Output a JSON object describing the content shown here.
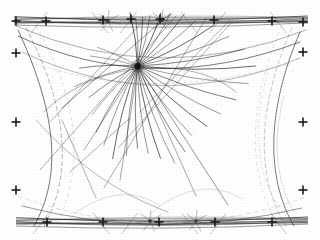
{
  "figure": {
    "kind": "particle-detector-event-display",
    "background_color": "#ffffff",
    "ink_color": "#2b2b2b",
    "faint_ink_color": "#7a7a7a",
    "width": 320,
    "height": 240
  },
  "fiducial": {
    "label": "fiducial-marks",
    "mark_glyph": "plus-cross",
    "color": "#1a1a1a",
    "arm_length": 4.5,
    "stroke": 1.6,
    "marks": [
      {
        "id": "fid-tl",
        "x": 16,
        "y": 21
      },
      {
        "id": "fid-t1",
        "x": 46,
        "y": 21
      },
      {
        "id": "fid-t2",
        "x": 103,
        "y": 20
      },
      {
        "id": "fid-t3",
        "x": 131,
        "y": 19
      },
      {
        "id": "fid-t4",
        "x": 160,
        "y": 19
      },
      {
        "id": "fid-t5",
        "x": 214,
        "y": 20
      },
      {
        "id": "fid-t6",
        "x": 272,
        "y": 21
      },
      {
        "id": "fid-tr",
        "x": 303,
        "y": 22
      },
      {
        "id": "fid-l1",
        "x": 16,
        "y": 53
      },
      {
        "id": "fid-l2",
        "x": 16,
        "y": 122
      },
      {
        "id": "fid-l3",
        "x": 16,
        "y": 190
      },
      {
        "id": "fid-r1",
        "x": 303,
        "y": 52
      },
      {
        "id": "fid-r2",
        "x": 303,
        "y": 122
      },
      {
        "id": "fid-r3",
        "x": 303,
        "y": 190
      },
      {
        "id": "fid-b1",
        "x": 47,
        "y": 222
      },
      {
        "id": "fid-b2",
        "x": 103,
        "y": 222
      },
      {
        "id": "fid-b3",
        "x": 159,
        "y": 222
      },
      {
        "id": "fid-b4",
        "x": 215,
        "y": 222
      },
      {
        "id": "fid-b5",
        "x": 272,
        "y": 222
      }
    ]
  },
  "vertex": {
    "label": "primary-interaction-vertex",
    "x": 137.5,
    "y": 66,
    "blob_radius": 3.2,
    "color": "#111111",
    "track_count": 30
  },
  "secondary_vertices": [
    {
      "id": "sv-top-a",
      "x": 108,
      "y": 21,
      "r": 2.0
    },
    {
      "id": "sv-top-b",
      "x": 162,
      "y": 20,
      "r": 2.2
    },
    {
      "id": "sv-bottom-a",
      "x": 150,
      "y": 221,
      "r": 2.0
    },
    {
      "id": "sv-bottom-b",
      "x": 196,
      "y": 221,
      "r": 1.8
    }
  ],
  "chart_data": {
    "type": "scatter",
    "title": "",
    "xlabel": "",
    "ylabel": "",
    "grid": false,
    "legend": "none",
    "xlim": [
      0,
      320
    ],
    "ylim": [
      0,
      240
    ],
    "vertex_tracks_deg": [
      -96,
      -88,
      -80,
      -72,
      -64,
      -56,
      -48,
      -40,
      -30,
      -20,
      -8,
      4,
      16,
      28,
      40,
      52,
      62,
      70,
      78,
      86,
      94,
      100,
      108,
      116,
      124,
      134,
      146,
      160,
      176,
      190
    ]
  },
  "tracks": {
    "vertex_spray": [
      {
        "id": "t01",
        "angle": -98,
        "len": 54,
        "w": 0.9,
        "op": 0.85
      },
      {
        "id": "t02",
        "angle": -92,
        "len": 47,
        "w": 0.7,
        "op": 0.75
      },
      {
        "id": "t03",
        "angle": -84,
        "len": 49,
        "w": 0.8,
        "op": 0.8
      },
      {
        "id": "t04",
        "angle": -76,
        "len": 52,
        "w": 0.7,
        "op": 0.7
      },
      {
        "id": "t05",
        "angle": -66,
        "len": 58,
        "w": 0.9,
        "op": 0.85
      },
      {
        "id": "t06",
        "angle": -58,
        "len": 62,
        "w": 0.7,
        "op": 0.7
      },
      {
        "id": "t07",
        "angle": -48,
        "len": 70,
        "w": 0.8,
        "op": 0.78
      },
      {
        "id": "t08",
        "angle": -38,
        "len": 74,
        "w": 0.7,
        "op": 0.68
      },
      {
        "id": "t09",
        "angle": -28,
        "len": 86,
        "w": 0.9,
        "op": 0.82
      },
      {
        "id": "t10",
        "angle": -18,
        "len": 96,
        "w": 0.7,
        "op": 0.7
      },
      {
        "id": "t11",
        "angle": -9,
        "len": 108,
        "w": 0.8,
        "op": 0.75
      },
      {
        "id": "t12",
        "angle": 0,
        "len": 118,
        "w": 0.9,
        "op": 0.8
      },
      {
        "id": "t13",
        "angle": 9,
        "len": 112,
        "w": 0.7,
        "op": 0.66
      },
      {
        "id": "t14",
        "angle": 19,
        "len": 104,
        "w": 0.8,
        "op": 0.74
      },
      {
        "id": "t15",
        "angle": 30,
        "len": 96,
        "w": 0.7,
        "op": 0.68
      },
      {
        "id": "t16",
        "angle": 41,
        "len": 92,
        "w": 0.9,
        "op": 0.8
      },
      {
        "id": "t17",
        "angle": 52,
        "len": 88,
        "w": 0.7,
        "op": 0.7
      },
      {
        "id": "t18",
        "angle": 61,
        "len": 98,
        "w": 0.8,
        "op": 0.76
      },
      {
        "id": "t19",
        "angle": 69,
        "len": 104,
        "w": 0.7,
        "op": 0.68
      },
      {
        "id": "t20",
        "angle": 76,
        "len": 95,
        "w": 0.9,
        "op": 0.82
      },
      {
        "id": "t21",
        "angle": 83,
        "len": 88,
        "w": 0.7,
        "op": 0.7
      },
      {
        "id": "t22",
        "angle": 90,
        "len": 82,
        "w": 0.8,
        "op": 0.76
      },
      {
        "id": "t23",
        "angle": 97,
        "len": 90,
        "w": 0.7,
        "op": 0.68
      },
      {
        "id": "t24",
        "angle": 105,
        "len": 96,
        "w": 0.9,
        "op": 0.8
      },
      {
        "id": "t25",
        "angle": 113,
        "len": 86,
        "w": 0.7,
        "op": 0.68
      },
      {
        "id": "t26",
        "angle": 122,
        "len": 78,
        "w": 0.8,
        "op": 0.74
      },
      {
        "id": "t27",
        "angle": 133,
        "len": 66,
        "w": 0.7,
        "op": 0.66
      },
      {
        "id": "t28",
        "angle": 147,
        "len": 58,
        "w": 0.8,
        "op": 0.72
      },
      {
        "id": "t29",
        "angle": 162,
        "len": 66,
        "w": 0.7,
        "op": 0.66
      },
      {
        "id": "t30",
        "angle": 178,
        "len": 58,
        "w": 0.8,
        "op": 0.74
      },
      {
        "id": "t31",
        "angle": 192,
        "len": 48,
        "w": 0.7,
        "op": 0.62
      },
      {
        "id": "t32",
        "angle": 205,
        "len": 44,
        "w": 0.7,
        "op": 0.6
      }
    ],
    "long_chords": [
      {
        "id": "lc1",
        "x1": 138,
        "y1": 66,
        "x2": 228,
        "y2": 205,
        "w": 0.8,
        "op": 0.62
      },
      {
        "id": "lc2",
        "x1": 138,
        "y1": 66,
        "x2": 196,
        "y2": 196,
        "w": 0.7,
        "op": 0.58
      },
      {
        "id": "lc3",
        "x1": 138,
        "y1": 66,
        "x2": 120,
        "y2": 180,
        "w": 0.7,
        "op": 0.6
      },
      {
        "id": "lc4",
        "x1": 138,
        "y1": 66,
        "x2": 84,
        "y2": 150,
        "w": 0.7,
        "op": 0.58
      },
      {
        "id": "lc5",
        "x1": 62,
        "y1": 108,
        "x2": 170,
        "y2": 14,
        "w": 0.8,
        "op": 0.62
      },
      {
        "id": "lc6",
        "x1": 40,
        "y1": 170,
        "x2": 176,
        "y2": 16,
        "w": 0.7,
        "op": 0.55
      },
      {
        "id": "lc7",
        "x1": 104,
        "y1": 188,
        "x2": 206,
        "y2": 18,
        "w": 0.7,
        "op": 0.55
      },
      {
        "id": "lc8",
        "x1": 50,
        "y1": 122,
        "x2": 146,
        "y2": 18,
        "w": 0.7,
        "op": 0.52
      },
      {
        "id": "lc9",
        "x1": 96,
        "y1": 198,
        "x2": 62,
        "y2": 120,
        "w": 0.7,
        "op": 0.55
      },
      {
        "id": "lc10",
        "x1": 118,
        "y1": 148,
        "x2": 232,
        "y2": 22,
        "w": 0.7,
        "op": 0.5
      },
      {
        "id": "lc11",
        "x1": 70,
        "y1": 172,
        "x2": 130,
        "y2": 118,
        "w": 0.7,
        "op": 0.55
      },
      {
        "id": "lc12",
        "x1": 230,
        "y1": 20,
        "x2": 140,
        "y2": 112,
        "w": 0.7,
        "op": 0.52
      }
    ],
    "arcs": [
      {
        "id": "a1",
        "d": "M 18,36 Q 150,98 300,42",
        "w": 0.9,
        "op": 0.7,
        "dash": "none"
      },
      {
        "id": "a2",
        "d": "M 22,52 Q 158,116 300,58",
        "w": 0.7,
        "op": 0.5,
        "dash": "none"
      },
      {
        "id": "a3",
        "d": "M 30,62 Q 150,104 288,64",
        "w": 0.6,
        "op": 0.38,
        "dash": "3 3"
      },
      {
        "id": "a4",
        "d": "M 16,26 Q 160,88 306,30",
        "w": 0.7,
        "op": 0.55,
        "dash": "none"
      },
      {
        "id": "a5",
        "d": "M 18,30 C 60,120 60,180 34,226",
        "w": 0.9,
        "op": 0.72,
        "dash": "none"
      },
      {
        "id": "a6",
        "d": "M 26,28 C 72,116 70,180 44,226",
        "w": 0.7,
        "op": 0.5,
        "dash": "4 3"
      },
      {
        "id": "a7",
        "d": "M 36,26 C 86,112 80,178 56,226",
        "w": 0.6,
        "op": 0.42,
        "dash": "3 4"
      },
      {
        "id": "a8",
        "d": "M 300,32 C 264,116 268,182 294,226",
        "w": 0.9,
        "op": 0.7,
        "dash": "none"
      },
      {
        "id": "a9",
        "d": "M 292,28 C 254,114 258,182 286,226",
        "w": 0.6,
        "op": 0.45,
        "dash": "4 3"
      },
      {
        "id": "a10",
        "d": "M 282,26 C 244,112 250,180 278,224",
        "w": 0.6,
        "op": 0.38,
        "dash": "3 4"
      },
      {
        "id": "a11",
        "d": "M 22,206 Q 160,242 302,208",
        "w": 0.8,
        "op": 0.6,
        "dash": "none"
      },
      {
        "id": "a12",
        "d": "M 18,196 Q 158,248 304,198",
        "w": 0.6,
        "op": 0.4,
        "dash": "4 4"
      },
      {
        "id": "a13",
        "d": "M 44,112 C 96,60 190,54 236,92",
        "w": 0.7,
        "op": 0.52,
        "dash": "none"
      },
      {
        "id": "a14",
        "d": "M 60,100 C 110,58 190,56 228,86",
        "w": 0.6,
        "op": 0.35,
        "dash": "2 3"
      },
      {
        "id": "a15",
        "d": "M 150,214 C 182,186 216,182 244,200",
        "w": 0.6,
        "op": 0.42,
        "dash": "none"
      },
      {
        "id": "a16",
        "d": "M 74,214 C 104,192 134,188 160,206",
        "w": 0.6,
        "op": 0.42,
        "dash": "none"
      },
      {
        "id": "a17",
        "d": "M 36,120 C 80,168 120,194 168,212",
        "w": 0.7,
        "op": 0.5,
        "dash": "none"
      },
      {
        "id": "a18",
        "d": "M 284,96 C 272,140 276,182 294,212",
        "w": 0.6,
        "op": 0.4,
        "dash": "none"
      },
      {
        "id": "a19",
        "d": "M 268,72 C 250,130 258,184 286,216",
        "w": 0.6,
        "op": 0.34,
        "dash": "3 3"
      }
    ],
    "top_band": {
      "id": "top-track-band",
      "y": 21,
      "x_start": 16,
      "x_end": 306,
      "line_count": 11,
      "note": "dense bundle of near-horizontal beam tracks across the top of the frame"
    },
    "bottom_band": {
      "id": "bottom-track-band",
      "y": 222,
      "x_start": 18,
      "x_end": 306,
      "line_count": 11,
      "note": "dense bundle of near-horizontal tracks across the bottom of the frame"
    }
  }
}
